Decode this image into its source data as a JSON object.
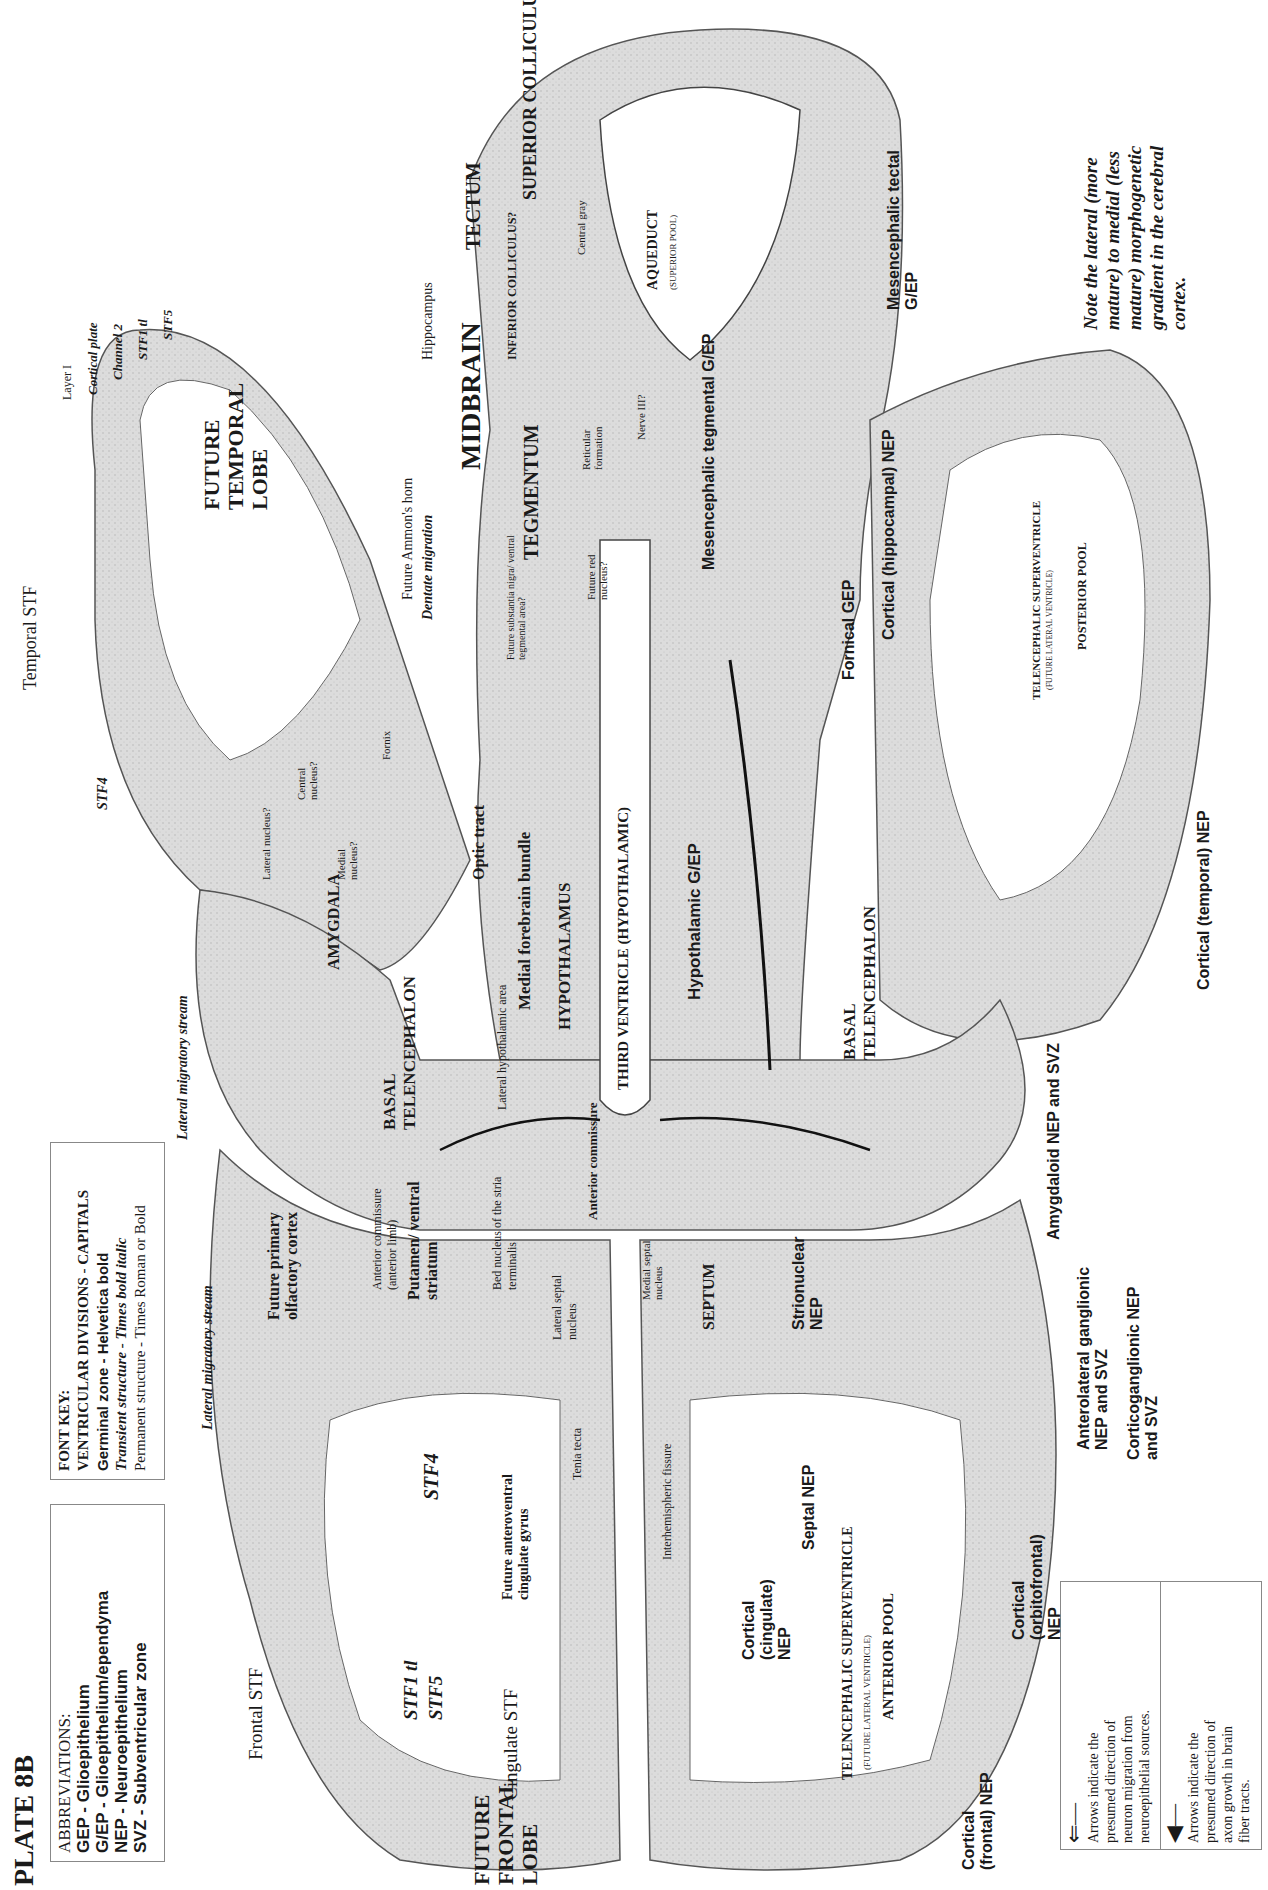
{
  "plate": {
    "title": "PLATE 8B",
    "abbreviations": {
      "heading": "ABBREVIATIONS:",
      "items": [
        "GEP - Glioepithelium",
        "G/EP - Glioepithelium/ependyma",
        "NEP - Neuroepithelium",
        "SVZ - Subventricular zone"
      ]
    },
    "font_key": {
      "heading": "FONT KEY:",
      "items": [
        "VENTRICULAR DIVISIONS - CAPITALS",
        "Germinal zone - Helvetica bold",
        "Transient structure - Times bold italic",
        "Permanent structure - Times Roman or Bold"
      ]
    },
    "note": [
      "Note the lateral (more",
      "mature) to medial (less",
      "mature) morphogenetic",
      "gradient in the cerebral",
      "cortex."
    ],
    "legend": [
      {
        "icon": "double-arrow-icon",
        "lines": [
          "Arrows indicate the",
          "presumed direction of",
          "neuron migration from",
          "neuroepithelial sources."
        ]
      },
      {
        "icon": "solid-arrow-icon",
        "lines": [
          "Arrows indicate the",
          "presumed direction of",
          "axon growth in brain",
          "fiber tracts."
        ]
      }
    ]
  },
  "labels": {
    "midbrain": "MIDBRAIN",
    "tectum": "TECTUM",
    "superior_colliculus": "SUPERIOR COLLICULUS",
    "inferior_colliculus": "INFERIOR COLLICULUS?",
    "central_gray": "Central gray",
    "aqueduct": "AQUEDUCT",
    "aqueduct_sub": "(SUPERIOR POOL)",
    "mesencephalic_tectal": "Mesencephalic tectal G/EP",
    "mesencephalic_tegmental": "Mesencephalic tegmental G/EP",
    "tegmentum": "TEGMENTUM",
    "reticular_formation": "Reticular formation",
    "nerve_iii": "Nerve III?",
    "substantia_nigra": "Future substantia nigra/ ventral tegmental area?",
    "red_nucleus": "Future red nucleus?",
    "future_temporal_lobe": "FUTURE TEMPORAL LOBE",
    "hippocampus": "Hippocampus",
    "ammons_horn": "Future Ammon's horn",
    "dentate_migration": "Dentate migration",
    "layer1": "Layer I",
    "cortical_plate": "Cortical plate",
    "channel2": "Channel 2",
    "stf1_tl_temporal": "STF1 tl",
    "stf5_temporal": "STF5",
    "temporal_stf": "Temporal STF",
    "stf4_temporal": "STF4",
    "central_nucleus": "Central nucleus?",
    "lateral_nucleus": "Lateral nucleus?",
    "medial_nucleus": "Medial nucleus?",
    "amygdala": "AMYGDALA",
    "fornix": "Fornix",
    "optic_tract": "Optic tract",
    "lateral_migratory_stream_1": "Lateral migratory stream",
    "basal_telencephalon_1": "BASAL TELENCEPHALON",
    "lateral_hypothalamic_area": "Lateral hypothalamic area",
    "medial_forebrain_bundle": "Medial forebrain bundle",
    "hypothalamus": "HYPOTHALAMUS",
    "third_ventricle": "THIRD VENTRICLE (HYPOTHALAMIC)",
    "hypothalamic_gep": "Hypothalamic G/EP",
    "basal_telencephalon_2": "BASAL TELENCEPHALON",
    "fornical_gep": "Fornical GEP",
    "cortical_hippocampal": "Cortical (hippocampal) NEP",
    "telencephalic_superventricle_post": "TELENCEPHALIC SUPERVENTRICLE",
    "future_lateral_ventricle_post": "(FUTURE LATERAL VENTRICLE)",
    "posterior_pool": "POSTERIOR POOL",
    "cortical_temporal": "Cortical (temporal) NEP",
    "amygdaloid": "Amygdaloid NEP and SVZ",
    "anterior_commissure": "Anterior commissure",
    "future_primary_olfactory": "Future primary olfactory cortex",
    "lateral_migratory_stream_2": "Lateral migratory stream",
    "anterior_commissure_limb": "Anterior commissure (anterior limb)",
    "putamen": "Putamen/ ventral striatum",
    "bed_nucleus": "Bed nucleus of the stria terminalis",
    "lateral_septal": "Lateral septal nucleus",
    "medial_septal": "Medial septal nucleus",
    "septum": "SEPTUM",
    "strionuclear": "Strionuclear NEP",
    "anterolateral": "Anterolateral ganglionic NEP and SVZ",
    "corticoganglionic": "Corticoganglionic NEP and SVZ",
    "tenia_tecta": "Tenia tecta",
    "stf4_frontal": "STF4",
    "septal_nep": "Septal NEP",
    "future_anteroventral": "Future anteroventral cingulate gyrus",
    "interhemispheric": "Interhemispheric fissure",
    "cortical_cingulate": "Cortical (cingulate) NEP",
    "telencephalic_superventricle_ant": "TELENCEPHALIC SUPERVENTRICLE",
    "future_lateral_ventricle_ant": "(FUTURE LATERAL VENTRICLE)",
    "anterior_pool": "ANTERIOR POOL",
    "cortical_orbitofrontal": "Cortical (orbitofrontal) NEP",
    "frontal_stf": "Frontal STF",
    "stf1_tl_frontal": "STF1 tl",
    "stf5_frontal": "STF5",
    "cingulate_stf": "Cingulate STF",
    "future_frontal_lobe": "FUTURE FRONTAL LOBE",
    "cortical_frontal": "Cortical (frontal) NEP"
  },
  "colors": {
    "tissue": "#d9d9d9",
    "tissue_dark": "#bdbdbd",
    "line": "#333333",
    "ventricle": "#ffffff"
  }
}
